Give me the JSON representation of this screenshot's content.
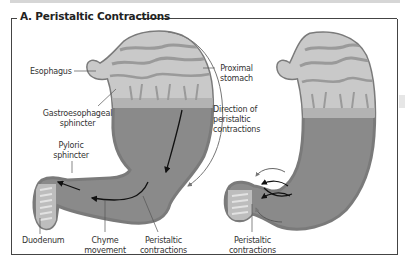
{
  "figure": {
    "title": "A. Peristaltic Contractions"
  },
  "left_panel": {
    "labels": {
      "esophagus": "Esophagus",
      "ge_sphincter_line1": "Gastroesophageal",
      "ge_sphincter_line2": "sphincter",
      "pyloric_line1": "Pyloric",
      "pyloric_line2": "sphincter",
      "duodenum": "Duodenum",
      "chyme_line1": "Chyme",
      "chyme_line2": "movement",
      "peristaltic_line1": "Peristaltic",
      "peristaltic_line2": "contractions",
      "proximal_line1": "Proximal",
      "proximal_line2": "stomach",
      "direction_line1": "Direction of",
      "direction_line2": "peristaltic",
      "direction_line3": "contractions"
    }
  },
  "right_panel": {
    "labels": {
      "peristaltic_line1": "Peristaltic",
      "peristaltic_line2": "contractions"
    }
  },
  "colors": {
    "stomach_wall": "#8c8c8c",
    "mucosa_light": "#c8c8c8",
    "contents_dark": "#8a8a8a",
    "frame": "#444444",
    "arrow": "#111111",
    "direction_arrow": "#777777"
  }
}
